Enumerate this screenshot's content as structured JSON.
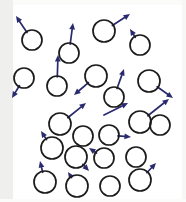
{
  "figure": {
    "width": 186,
    "height": 202,
    "background_color": "#ffffff",
    "margin_band_color": "#efefed",
    "circle_stroke_color": "#1b1b1b",
    "arrow_color": "#2a2a6e",
    "circle_radius": 10,
    "particle_count": 22,
    "caption": ""
  },
  "chart_data": {
    "type": "scatter",
    "xlabel": "",
    "ylabel": "",
    "xlim": [
      0,
      186
    ],
    "ylim": [
      0,
      202
    ],
    "grid": false,
    "legend": "none",
    "marker": "open-circle",
    "marker_radius": 10,
    "vector_field": true,
    "particles": [
      {
        "id": "p01",
        "cx": 32,
        "cy": 40,
        "r": 10,
        "vx": -16,
        "vy": -24,
        "has_arrow": true
      },
      {
        "id": "p02",
        "cx": 69,
        "cy": 53,
        "r": 10,
        "vx": 4,
        "vy": -30,
        "has_arrow": true
      },
      {
        "id": "p03",
        "cx": 104,
        "cy": 31,
        "r": 11,
        "vx": 26,
        "vy": -17,
        "has_arrow": true
      },
      {
        "id": "p04",
        "cx": 140,
        "cy": 45,
        "r": 10,
        "vx": -10,
        "vy": -16,
        "has_arrow": true
      },
      {
        "id": "p05",
        "cx": 24,
        "cy": 78,
        "r": 10,
        "vx": -12,
        "vy": 20,
        "has_arrow": true
      },
      {
        "id": "p06",
        "cx": 57,
        "cy": 86,
        "r": 10,
        "vx": 1,
        "vy": -31,
        "has_arrow": true
      },
      {
        "id": "p07",
        "cx": 96,
        "cy": 76,
        "r": 11,
        "vx": -22,
        "vy": 19,
        "has_arrow": true
      },
      {
        "id": "p08",
        "cx": 114,
        "cy": 97,
        "r": 10,
        "vx": 10,
        "vy": -28,
        "has_arrow": true
      },
      {
        "id": "p09",
        "cx": 149,
        "cy": 81,
        "r": 11,
        "vx": 24,
        "vy": 17,
        "has_arrow": true
      },
      {
        "id": "p10",
        "cx": 140,
        "cy": 122,
        "r": 11,
        "vx": 29,
        "vy": -23,
        "has_arrow": true
      },
      {
        "id": "p11",
        "cx": 60,
        "cy": 124,
        "r": 11,
        "vx": 26,
        "vy": -21,
        "has_arrow": true
      },
      {
        "id": "p12",
        "cx": 83,
        "cy": 136,
        "r": 10,
        "vx": 0,
        "vy": 0,
        "has_arrow": false
      },
      {
        "id": "p13",
        "cx": 109,
        "cy": 135,
        "r": 10,
        "vx": 22,
        "vy": 2,
        "has_arrow": true
      },
      {
        "id": "p14",
        "cx": 52,
        "cy": 148,
        "r": 11,
        "vx": -11,
        "vy": -17,
        "has_arrow": true
      },
      {
        "id": "p15",
        "cx": 76,
        "cy": 157,
        "r": 11,
        "vx": 13,
        "vy": 14,
        "has_arrow": true
      },
      {
        "id": "p16",
        "cx": 104,
        "cy": 158,
        "r": 10,
        "vx": -15,
        "vy": -10,
        "has_arrow": true
      },
      {
        "id": "p17",
        "cx": 136,
        "cy": 157,
        "r": 10,
        "vx": 0,
        "vy": 0,
        "has_arrow": false
      },
      {
        "id": "p18",
        "cx": 45,
        "cy": 182,
        "r": 11,
        "vx": -5,
        "vy": -21,
        "has_arrow": true
      },
      {
        "id": "p19",
        "cx": 77,
        "cy": 186,
        "r": 11,
        "vx": -9,
        "vy": -14,
        "has_arrow": true
      },
      {
        "id": "p20",
        "cx": 110,
        "cy": 186,
        "r": 10,
        "vx": 0,
        "vy": 0,
        "has_arrow": false
      },
      {
        "id": "p21",
        "cx": 140,
        "cy": 180,
        "r": 11,
        "vx": 16,
        "vy": -17,
        "has_arrow": true
      },
      {
        "id": "p22",
        "cx": 160,
        "cy": 125,
        "r": 10,
        "vx": 0,
        "vy": 0,
        "has_arrow": false
      }
    ],
    "extra_vectors": [
      {
        "id": "v01",
        "x1": 104,
        "y1": 115,
        "x2": 128,
        "y2": 103
      }
    ]
  }
}
